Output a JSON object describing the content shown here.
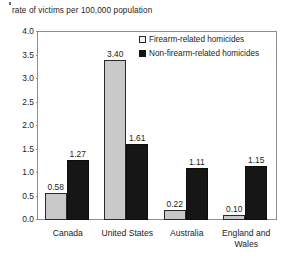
{
  "chart_data": {
    "type": "bar",
    "title": "",
    "ylabel": "rate of victims per 100,000 population",
    "xlabel": "",
    "ylim": [
      0,
      4.0
    ],
    "ytick_step": 0.5,
    "grid": false,
    "legend_position": "top-right-inside",
    "categories": [
      "Canada",
      "United States",
      "Australia",
      "England and Wales"
    ],
    "series": [
      {
        "name": "Firearm-related homicides",
        "color": "#c9c9c9",
        "values": [
          0.58,
          3.4,
          0.22,
          0.1
        ],
        "labels": [
          "0.58",
          "3.40",
          "0.22",
          "0.10"
        ]
      },
      {
        "name": "Non-firearm-related homicides",
        "color": "#161616",
        "values": [
          1.27,
          1.61,
          1.11,
          1.15
        ],
        "labels": [
          "1.27",
          "1.61",
          "1.11",
          "1.15"
        ]
      }
    ],
    "ytick_labels": [
      "4.0",
      "3.5",
      "3.0",
      "2.5",
      "2.0",
      "1.5",
      "1.0",
      "0.5",
      "0.0"
    ],
    "ytick_values": [
      4.0,
      3.5,
      3.0,
      2.5,
      2.0,
      1.5,
      1.0,
      0.5,
      0.0
    ]
  },
  "axis": {
    "y_title": "rate of victims per 100,000 population"
  },
  "legend": {
    "items": [
      {
        "label": "Firearm-related homicides",
        "swatch": "light"
      },
      {
        "label": "Non-firearm-related homicides",
        "swatch": "dark"
      }
    ]
  }
}
